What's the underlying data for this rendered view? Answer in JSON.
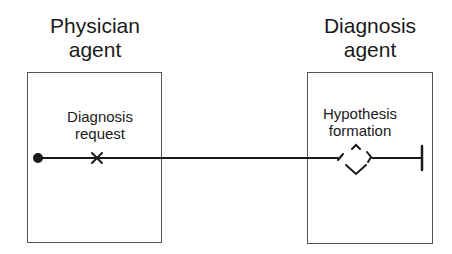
{
  "diagram": {
    "type": "use-case-map",
    "components": [
      {
        "id": "physician",
        "title_line1": "Physician",
        "title_line2": "agent",
        "responsibility_line1": "Diagnosis",
        "responsibility_line2": "request"
      },
      {
        "id": "diagnosis",
        "title_line1": "Diagnosis",
        "title_line2": "agent",
        "responsibility_line1": "Hypothesis",
        "responsibility_line2": "formation"
      }
    ],
    "path": {
      "start": "filled-circle",
      "responsibility_marker": "x-cross",
      "fork": "or-fork-diamond",
      "end": "end-bar"
    },
    "colors": {
      "stroke": "#1a1a1a",
      "box": "#555555"
    }
  }
}
